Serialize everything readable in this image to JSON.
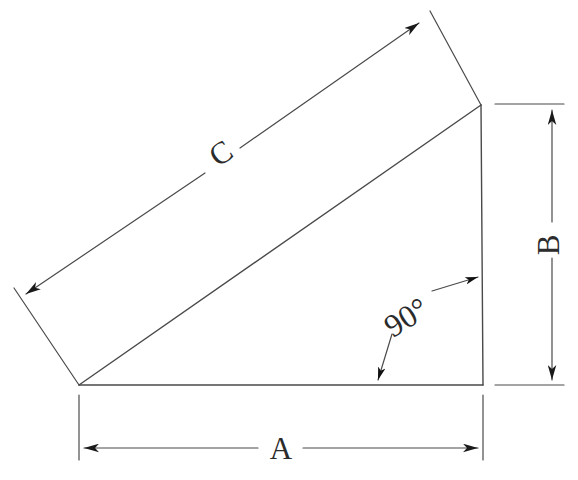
{
  "figure": {
    "type": "geometry-diagram",
    "background_color": "#ffffff",
    "line_color": "#4a4a4a",
    "text_color": "#2b2b2b",
    "stroke_width": 1.3,
    "canvas": {
      "width": 578,
      "height": 480
    }
  },
  "shape": {
    "name": "right-triangle",
    "vertices": {
      "bottom_left": {
        "x": 79,
        "y": 385
      },
      "bottom_right": {
        "x": 483,
        "y": 385
      },
      "top_right": {
        "x": 481,
        "y": 105
      }
    },
    "sides": [
      {
        "id": "A",
        "name": "base-adjacent",
        "from": "bottom_left",
        "to": "bottom_right"
      },
      {
        "id": "B",
        "name": "vertical-opposite",
        "from": "bottom_right",
        "to": "top_right"
      },
      {
        "id": "C",
        "name": "hypotenuse",
        "from": "bottom_left",
        "to": "top_right"
      }
    ]
  },
  "labels": {
    "side_a": "A",
    "side_b": "B",
    "side_c": "C",
    "angle": "90°"
  },
  "dimensions": [
    {
      "id": "A",
      "label": "A",
      "orientation": "horizontal",
      "line": {
        "x1": 79,
        "y1": 448,
        "x2": 483,
        "y2": 448
      },
      "label_position": {
        "x": 281,
        "y": 455
      },
      "label_rotation": 0,
      "arrows": "both-ends"
    },
    {
      "id": "B",
      "label": "B",
      "orientation": "vertical",
      "line": {
        "x1": 552,
        "y1": 105,
        "x2": 552,
        "y2": 385
      },
      "label_position": {
        "x": 552,
        "y": 245
      },
      "label_rotation": -90,
      "arrows": "both-ends"
    },
    {
      "id": "C",
      "label": "C",
      "orientation": "diagonal",
      "line": {
        "x1": 21,
        "y1": 291,
        "x2": 424,
        "y2": 18
      },
      "label_position": {
        "x": 222,
        "y": 155
      },
      "label_rotation": -34,
      "arrows": "both-ends"
    }
  ],
  "angle_marker": {
    "text": "90°",
    "position": {
      "x": 406,
      "y": 317
    },
    "rotation": -32,
    "leaders": [
      {
        "name": "leader-to-base",
        "from": {
          "x": 392,
          "y": 334
        },
        "to": {
          "x": 378,
          "y": 380
        }
      },
      {
        "name": "leader-to-vertical",
        "from": {
          "x": 432,
          "y": 291
        },
        "to": {
          "x": 478,
          "y": 277
        }
      }
    ]
  }
}
